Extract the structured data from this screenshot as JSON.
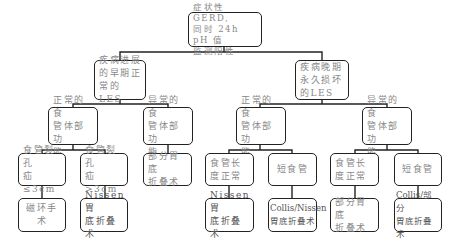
{
  "root": {
    "label": "症状性 GERD,\n同时 24h pH 值\n监测阳性"
  },
  "level1": [
    {
      "label": "疾病进展\n的早期正\n常的LES"
    },
    {
      "label": "疾病晚期\n永久损坏\n的LES"
    }
  ],
  "level2": [
    {
      "label": "正常的食\n管体部功\n能"
    },
    {
      "label": "异常的食\n管体部功\n能"
    },
    {
      "label": "正常的食\n管体部功\n能"
    },
    {
      "label": "异常的食\n管体部功\n能"
    }
  ],
  "level3": [
    {
      "label": "食管裂孔\n疝≤3cm"
    },
    {
      "label": "食管裂孔\n疝>3cm"
    },
    {
      "label": "部分胃底\n折叠术"
    },
    {
      "label": "食管长\n度正常"
    },
    {
      "label": "短食管"
    },
    {
      "label": "食管长\n度正常"
    },
    {
      "label": "短食管"
    }
  ],
  "level4": [
    {
      "label": "磁环手术"
    },
    {
      "label": "Nissen 胃\n底折叠术"
    },
    {
      "label": "Nissen 胃\n底折叠术"
    },
    {
      "label": "Collis/Nissen\n胃底折叠术"
    },
    {
      "label": "部分胃底\n折叠术"
    },
    {
      "label": "Collis/部分\n胃底折叠术"
    }
  ]
}
